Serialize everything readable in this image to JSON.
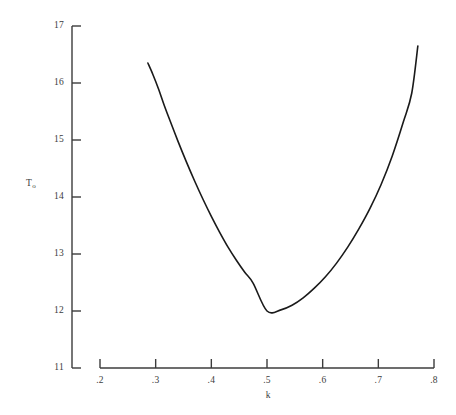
{
  "chart_data": {
    "type": "line",
    "title": "",
    "subtitle": "",
    "xlabel": "k",
    "ylabel": "T",
    "ylabel_subscript": "o",
    "xlim": [
      0.2,
      0.8
    ],
    "ylim": [
      11,
      17
    ],
    "grid": false,
    "legend": null,
    "line_color": "#1a1a1a",
    "axis_color": "#3c3c3c",
    "x_ticks": [
      0.2,
      0.3,
      0.4,
      0.5,
      0.6,
      0.7,
      0.8
    ],
    "x_tick_labels": [
      ".2",
      ".3",
      ".4",
      ".5",
      ".6",
      ".7",
      ".8"
    ],
    "y_ticks": [
      11,
      12,
      13,
      14,
      15,
      16,
      17
    ],
    "y_tick_labels": [
      "11",
      "12",
      "13",
      "14",
      "15",
      "16",
      "17"
    ],
    "series": [
      {
        "name": "T0(k)",
        "x": [
          0.286,
          0.295,
          0.305,
          0.315,
          0.325,
          0.34,
          0.355,
          0.37,
          0.385,
          0.4,
          0.415,
          0.43,
          0.445,
          0.46,
          0.475,
          0.5,
          0.525,
          0.545,
          0.565,
          0.585,
          0.605,
          0.625,
          0.645,
          0.665,
          0.685,
          0.705,
          0.725,
          0.745,
          0.76,
          0.771
        ],
        "y": [
          16.35,
          16.15,
          15.9,
          15.62,
          15.36,
          14.98,
          14.62,
          14.28,
          13.96,
          13.66,
          13.38,
          13.12,
          12.89,
          12.68,
          12.49,
          12.0,
          12.02,
          12.1,
          12.23,
          12.4,
          12.6,
          12.84,
          13.12,
          13.44,
          13.8,
          14.22,
          14.72,
          15.32,
          15.82,
          16.65
        ],
        "minimum": {
          "x": 0.5,
          "y": 12.0
        },
        "endpoints": {
          "left": {
            "x": 0.286,
            "y": 16.35
          },
          "right": {
            "x": 0.771,
            "y": 16.65
          }
        }
      }
    ]
  },
  "axes": {
    "y_axis_name": "vertical-axis",
    "x_axis_name": "horizontal-axis"
  }
}
